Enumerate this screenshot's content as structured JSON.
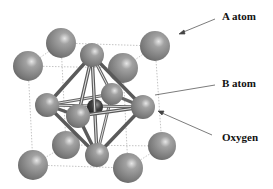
{
  "labels": {
    "a_atom": "A atom",
    "b_atom": "B atom",
    "oxygen": "Oxygen"
  },
  "colors": {
    "sphere": "#7a7a7a",
    "b_atom": "#3a3a3a",
    "bond": "#555555",
    "cell_edge": "#aaaaaa"
  }
}
